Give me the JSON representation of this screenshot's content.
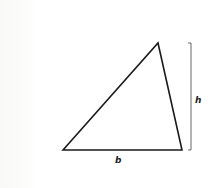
{
  "diagram": {
    "title": "",
    "shape": "triangle",
    "vertices": {
      "bottom_left": [
        63,
        150
      ],
      "apex": [
        158,
        43
      ],
      "bottom_right": [
        182,
        150
      ]
    },
    "height_bracket": {
      "x": 191,
      "y_top": 43,
      "y_bottom": 150
    },
    "labels": {
      "base": "b",
      "height": "h"
    },
    "colors": {
      "stroke": "#1a1a1a",
      "bracket": "#555555",
      "background": "#ffffff"
    }
  }
}
